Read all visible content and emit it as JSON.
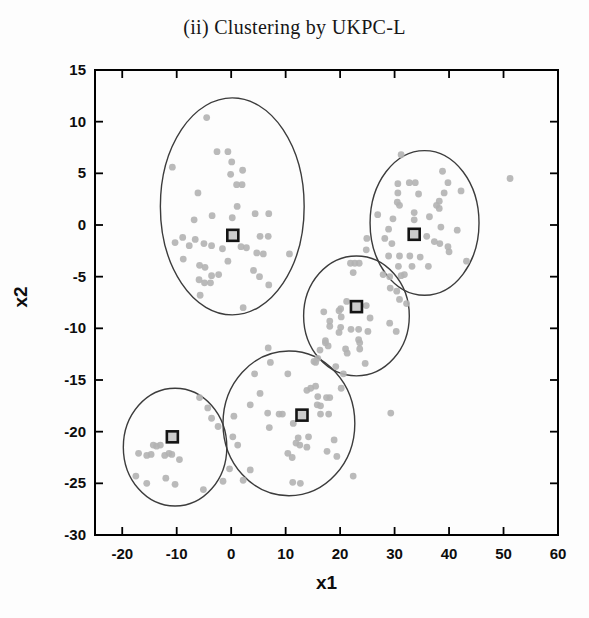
{
  "chart_data": {
    "type": "scatter",
    "title": "(ii) Clustering by UKPC-L",
    "xlabel": "x1",
    "ylabel": "x2",
    "xlim": [
      -25,
      60
    ],
    "ylim": [
      -30,
      15
    ],
    "xticks": [
      -20,
      -10,
      0,
      10,
      20,
      30,
      40,
      50,
      60
    ],
    "yticks": [
      15,
      10,
      5,
      0,
      -5,
      -10,
      -15,
      -20,
      -25,
      -30
    ],
    "grid": false,
    "legend": "none",
    "frame": "box-with-inward-ticks",
    "series": [
      {
        "name": "data points",
        "marker": "dot",
        "color": "#b3b3b3",
        "points": [
          [
            -4.5,
            10.4
          ],
          [
            -2.6,
            7.1
          ],
          [
            -0.6,
            7.1
          ],
          [
            0.1,
            6.1
          ],
          [
            -10.8,
            5.6
          ],
          [
            -0.1,
            4.9
          ],
          [
            2.1,
            5.3
          ],
          [
            1.0,
            3.9
          ],
          [
            2.0,
            3.9
          ],
          [
            -6.1,
            3.1
          ],
          [
            1.1,
            1.8
          ],
          [
            -3.5,
            0.9
          ],
          [
            0.2,
            0.7
          ],
          [
            4.4,
            1.1
          ],
          [
            6.9,
            1.1
          ],
          [
            -6.8,
            0.5
          ],
          [
            -8.9,
            -1.2
          ],
          [
            -10.3,
            -1.7
          ],
          [
            -7.7,
            -2.0
          ],
          [
            -6.6,
            -1.4
          ],
          [
            -5.0,
            -1.8
          ],
          [
            -3.6,
            -2.0
          ],
          [
            -1.6,
            -2.3
          ],
          [
            1.8,
            -2.1
          ],
          [
            2.8,
            -2.2
          ],
          [
            5.3,
            -1.1
          ],
          [
            6.8,
            -1.1
          ],
          [
            4.7,
            -2.7
          ],
          [
            5.9,
            -2.8
          ],
          [
            10.7,
            -2.8
          ],
          [
            -8.8,
            -3.3
          ],
          [
            -0.6,
            -3.5
          ],
          [
            -5.8,
            -3.9
          ],
          [
            -4.8,
            -4.1
          ],
          [
            -3.6,
            -4.9
          ],
          [
            -2.3,
            -4.8
          ],
          [
            -5.9,
            -5.3
          ],
          [
            -4.9,
            -5.6
          ],
          [
            -3.8,
            -5.6
          ],
          [
            4.1,
            -4.4
          ],
          [
            5.2,
            -5.0
          ],
          [
            6.9,
            -5.8
          ],
          [
            -5.7,
            -6.8
          ],
          [
            2.2,
            -8.0
          ],
          [
            31.2,
            6.8
          ],
          [
            38.8,
            5.2
          ],
          [
            30.6,
            4.0
          ],
          [
            32.7,
            4.1
          ],
          [
            33.8,
            4.1
          ],
          [
            39.8,
            4.1
          ],
          [
            30.6,
            3.1
          ],
          [
            34.4,
            3.0
          ],
          [
            39.1,
            3.1
          ],
          [
            42.2,
            3.3
          ],
          [
            38.2,
            2.3
          ],
          [
            30.5,
            2.2
          ],
          [
            30.9,
            1.9
          ],
          [
            37.7,
            1.9
          ],
          [
            38.2,
            1.6
          ],
          [
            33.6,
            1.2
          ],
          [
            26.9,
            1.0
          ],
          [
            29.7,
            0.6
          ],
          [
            36.4,
            0.8
          ],
          [
            33.6,
            0.5
          ],
          [
            28.9,
            -0.4
          ],
          [
            38.5,
            -0.2
          ],
          [
            41.5,
            -0.5
          ],
          [
            24.9,
            -1.3
          ],
          [
            28.2,
            -1.3
          ],
          [
            29.5,
            -1.8
          ],
          [
            35.9,
            -1.1
          ],
          [
            37.3,
            -1.6
          ],
          [
            38.3,
            -1.8
          ],
          [
            39.8,
            -2.1
          ],
          [
            24.8,
            -2.4
          ],
          [
            40.0,
            -2.6
          ],
          [
            51.2,
            4.5
          ],
          [
            28.9,
            -3.0
          ],
          [
            30.9,
            -3.0
          ],
          [
            32.8,
            -3.0
          ],
          [
            34.7,
            -3.1
          ],
          [
            30.7,
            -4.0
          ],
          [
            33.2,
            -4.0
          ],
          [
            36.2,
            -4.0
          ],
          [
            43.2,
            -3.5
          ],
          [
            29.1,
            -5.0
          ],
          [
            31.2,
            -4.9
          ],
          [
            31.8,
            -4.8
          ],
          [
            29.2,
            -6.1
          ],
          [
            30.4,
            -6.4
          ],
          [
            30.9,
            -7.2
          ],
          [
            32.2,
            -7.6
          ],
          [
            21.9,
            -3.7
          ],
          [
            22.7,
            -3.7
          ],
          [
            23.5,
            -3.7
          ],
          [
            22.4,
            -4.6
          ],
          [
            27.9,
            -4.8
          ],
          [
            21.2,
            -7.4
          ],
          [
            20.1,
            -8.1
          ],
          [
            24.8,
            -7.8
          ],
          [
            17.0,
            -8.4
          ],
          [
            19.8,
            -8.3
          ],
          [
            20.2,
            -8.9
          ],
          [
            25.5,
            -9.0
          ],
          [
            18.1,
            -9.3
          ],
          [
            18.1,
            -9.8
          ],
          [
            20.1,
            -9.9
          ],
          [
            22.0,
            -10.1
          ],
          [
            23.4,
            -10.1
          ],
          [
            25.1,
            -10.3
          ],
          [
            19.8,
            -10.4
          ],
          [
            29.1,
            -9.5
          ],
          [
            30.3,
            -10.3
          ],
          [
            23.4,
            -11.1
          ],
          [
            23.6,
            -11.4
          ],
          [
            17.3,
            -11.2
          ],
          [
            17.8,
            -11.7
          ],
          [
            21.0,
            -12.0
          ],
          [
            21.3,
            -12.4
          ],
          [
            23.6,
            -12.0
          ],
          [
            16.3,
            -12.1
          ],
          [
            15.9,
            -12.9
          ],
          [
            15.5,
            -13.3
          ],
          [
            6.8,
            -11.9
          ],
          [
            17.3,
            -11.4
          ],
          [
            7.2,
            -13.3
          ],
          [
            15.2,
            -13.2
          ],
          [
            19.2,
            -13.7
          ],
          [
            24.6,
            -13.4
          ],
          [
            20.6,
            -14.4
          ],
          [
            4.3,
            -14.4
          ],
          [
            10.4,
            -14.4
          ],
          [
            20.2,
            -15.8
          ],
          [
            18.1,
            -16.7
          ],
          [
            5.3,
            -16.3
          ],
          [
            13.9,
            -16.0
          ],
          [
            14.6,
            -15.8
          ],
          [
            15.5,
            -15.6
          ],
          [
            15.9,
            -16.6
          ],
          [
            17.5,
            -16.7
          ],
          [
            15.8,
            -17.4
          ],
          [
            16.4,
            -17.5
          ],
          [
            3.5,
            -17.4
          ],
          [
            6.7,
            -18.2
          ],
          [
            8.8,
            -18.3
          ],
          [
            9.4,
            -18.3
          ],
          [
            11.4,
            -19.2
          ],
          [
            16.4,
            -18.3
          ],
          [
            17.9,
            -18.3
          ],
          [
            0.5,
            -18.5
          ],
          [
            7.0,
            -19.6
          ],
          [
            0.3,
            -20.5
          ],
          [
            12.3,
            -20.6
          ],
          [
            11.9,
            -21.1
          ],
          [
            12.6,
            -21.3
          ],
          [
            14.2,
            -20.5
          ],
          [
            13.9,
            -21.5
          ],
          [
            18.9,
            -20.8
          ],
          [
            17.6,
            -21.9
          ],
          [
            19.4,
            -22.4
          ],
          [
            10.4,
            -22.1
          ],
          [
            11.2,
            -22.5
          ],
          [
            1.2,
            -21.3
          ],
          [
            3.5,
            -23.7
          ],
          [
            -0.3,
            -23.6
          ],
          [
            2.2,
            -24.7
          ],
          [
            11.3,
            -24.9
          ],
          [
            12.7,
            -25.0
          ],
          [
            22.4,
            -24.3
          ],
          [
            29.3,
            -18.2
          ],
          [
            -5.8,
            -16.7
          ],
          [
            -4.3,
            -17.7
          ],
          [
            -3.6,
            -18.7
          ],
          [
            -2.4,
            -19.5
          ],
          [
            -17.0,
            -22.1
          ],
          [
            -15.5,
            -22.3
          ],
          [
            -14.7,
            -22.2
          ],
          [
            -14.3,
            -21.3
          ],
          [
            -13.7,
            -21.4
          ],
          [
            -13.0,
            -21.3
          ],
          [
            -12.2,
            -22.3
          ],
          [
            -11.4,
            -22.1
          ],
          [
            -10.9,
            -22.2
          ],
          [
            -9.5,
            -22.7
          ],
          [
            -17.5,
            -24.3
          ],
          [
            -15.5,
            -25.0
          ],
          [
            -12.0,
            -24.5
          ],
          [
            -10.3,
            -25.1
          ],
          [
            -5.1,
            -25.6
          ],
          [
            -1.5,
            -24.8
          ]
        ]
      },
      {
        "name": "cluster centroids",
        "marker": "square",
        "fill": "#cccccc",
        "stroke": "#141414",
        "points": [
          [
            0.3,
            -1.0
          ],
          [
            33.6,
            -0.9
          ],
          [
            23.0,
            -7.9
          ],
          [
            13.0,
            -18.4
          ],
          [
            -10.8,
            -20.5
          ]
        ]
      }
    ],
    "cluster_ellipses": [
      {
        "cx": 0.2,
        "cy": 1.8,
        "rx": 13.2,
        "ry": 10.5
      },
      {
        "cx": 35.5,
        "cy": 0.2,
        "rx": 10.0,
        "ry": 7.0
      },
      {
        "cx": 23.0,
        "cy": -8.8,
        "rx": 9.7,
        "ry": 5.8
      },
      {
        "cx": 10.6,
        "cy": -19.2,
        "rx": 12.1,
        "ry": 7.0
      },
      {
        "cx": -10.3,
        "cy": -21.5,
        "rx": 9.5,
        "ry": 5.7
      }
    ],
    "style": {
      "point_color": "#b3b3b3",
      "point_radius": 3.4,
      "ellipse_color": "#3c3c3c",
      "centroid_fill": "#cccccc",
      "centroid_stroke": "#141414",
      "centroid_size": 11,
      "axis_color": "#000000",
      "label_color": "#0d0d0d",
      "background": "#fdfdfd"
    }
  }
}
